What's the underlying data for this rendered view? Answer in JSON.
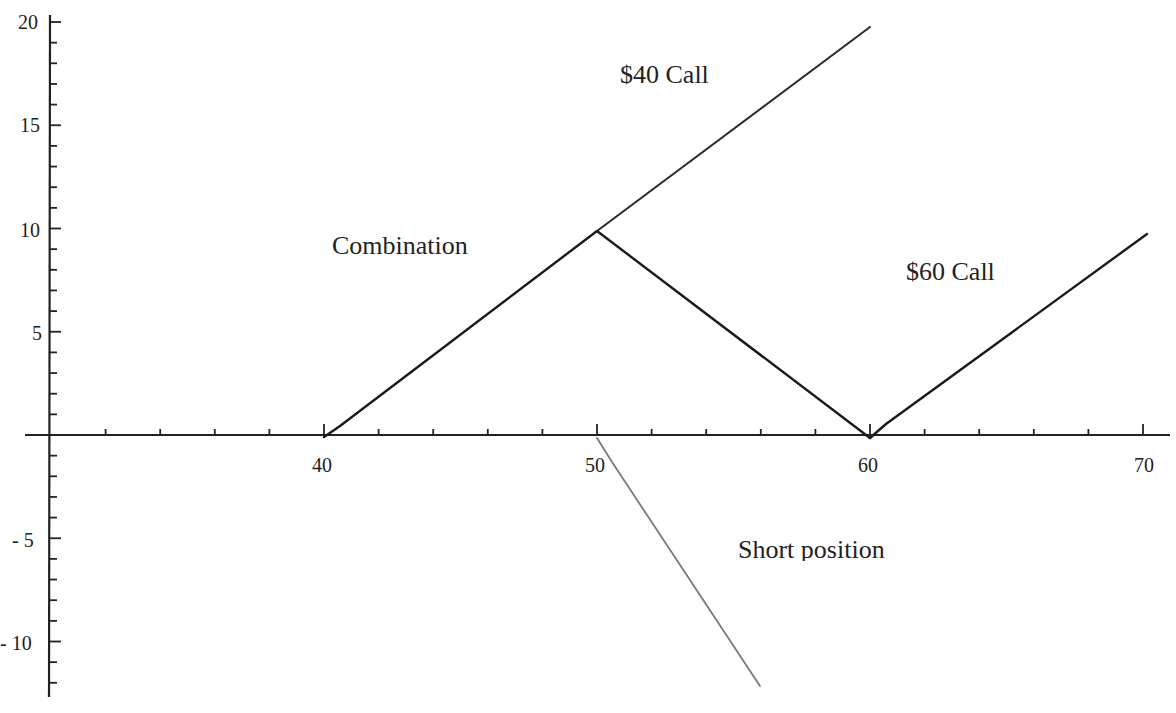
{
  "chart_data": {
    "type": "line",
    "title": "",
    "xlabel": "",
    "ylabel": "",
    "xlim": [
      30,
      70
    ],
    "ylim": [
      -12,
      20
    ],
    "grid": false,
    "legend": "inline labels",
    "x_ticks_major": [
      40,
      50,
      60,
      70
    ],
    "x_ticks_minor_step": 2,
    "y_ticks_major": [
      -10,
      -5,
      5,
      10,
      15,
      20
    ],
    "y_ticks_minor_step": 1,
    "x_tick_labels": [
      "40",
      "50",
      "60",
      "70"
    ],
    "y_tick_labels": [
      "20",
      "15",
      "10",
      "5",
      "- 5",
      "- 10"
    ],
    "series": [
      {
        "name": "$40 Call",
        "color": "#222222",
        "points": [
          [
            40,
            0
          ],
          [
            50,
            10
          ],
          [
            60,
            20
          ]
        ]
      },
      {
        "name": "Combination",
        "color": "#222222",
        "points": [
          [
            40,
            0
          ],
          [
            50,
            10
          ],
          [
            60,
            0
          ]
        ]
      },
      {
        "name": "$60 Call",
        "color": "#222222",
        "points": [
          [
            60,
            0
          ],
          [
            70,
            10
          ]
        ]
      },
      {
        "name": "Short position",
        "color": "#777777",
        "points": [
          [
            50,
            0
          ],
          [
            56,
            -12
          ]
        ]
      }
    ],
    "annotations": [
      {
        "text": "$40 Call",
        "x": 53,
        "y": 17.5
      },
      {
        "text": "Combination",
        "x": 41.5,
        "y": 9
      },
      {
        "text": "$60 Call",
        "x": 62.5,
        "y": 8
      },
      {
        "text": "Short position",
        "x": 55,
        "y": -5.5
      }
    ]
  },
  "labels": {
    "x_40": "40",
    "x_50": "50",
    "x_60": "60",
    "x_70": "70",
    "y_20": "20",
    "y_15": "15",
    "y_10": "10",
    "y_5": "5",
    "y_m5": "- 5",
    "y_m10": "- 10",
    "call40": "$40 Call",
    "combination": "Combination",
    "call60": "$60 Call",
    "short": "Short position"
  }
}
